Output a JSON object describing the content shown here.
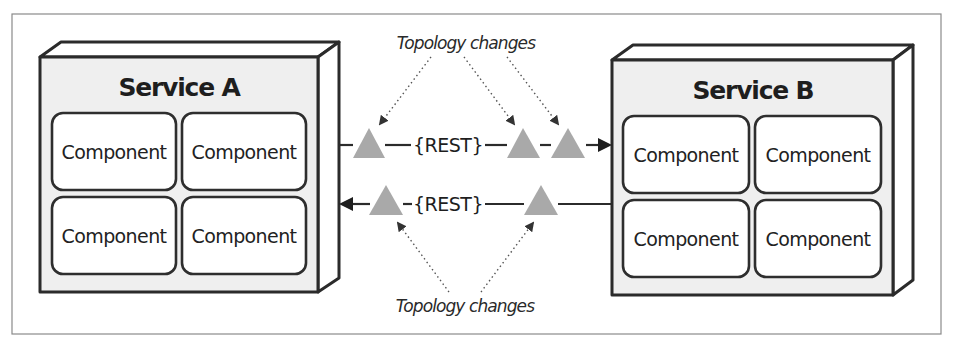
{
  "diagram": {
    "type": "service-communication",
    "colors": {
      "frame": "#8a8a8a",
      "box_face": "#efefef",
      "box_stroke": "#2b2b2b",
      "component_fill": "#ffffff",
      "triangle": "#a9a9a9",
      "text": "#1e1e1e"
    },
    "services": [
      {
        "id": "service-a",
        "title": "Service A",
        "components": [
          "Component",
          "Component",
          "Component",
          "Component"
        ]
      },
      {
        "id": "service-b",
        "title": "Service B",
        "components": [
          "Component",
          "Component",
          "Component",
          "Component"
        ]
      }
    ],
    "connections": [
      {
        "label": "{REST}",
        "direction": "Service A → Service B",
        "triangle_count": 3
      },
      {
        "label": "{REST}",
        "direction": "Service B → Service A",
        "triangle_count": 2
      }
    ],
    "annotations": {
      "top": "Topology changes",
      "bottom": "Topology changes"
    }
  }
}
